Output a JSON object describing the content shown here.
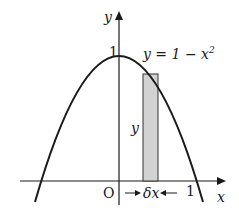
{
  "diagram": {
    "function_label": "y = 1 − x",
    "function_exponent": "2",
    "axis_x_label": "x",
    "axis_y_label": "y",
    "origin_label": "O",
    "y_intercept_label": "1",
    "x_intercept_label": "1",
    "strip_height_label": "y",
    "strip_width_label": "δx",
    "colors": {
      "stroke": "#1a1a1a",
      "strip_fill": "#d2d2d2",
      "background": "#ffffff"
    }
  }
}
